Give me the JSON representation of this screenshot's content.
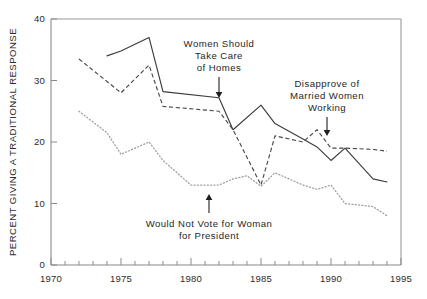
{
  "chart_data": {
    "type": "line",
    "title": "",
    "xlabel": "",
    "ylabel": "PERCENT GIVING A TRADITIONAL RESPONSE",
    "xlim": [
      1970,
      1995
    ],
    "ylim": [
      0,
      40
    ],
    "grid": false,
    "legend_position": "none (inline annotations with arrows)",
    "x_ticks_major": [
      1970,
      1975,
      1980,
      1985,
      1990,
      1995
    ],
    "x_tick_labels": [
      "1970",
      "1975",
      "1980",
      "1985",
      "1990",
      "1995"
    ],
    "x_ticks_minor_step": 1,
    "y_ticks": [
      0,
      10,
      20,
      30,
      40
    ],
    "y_tick_labels": [
      "0",
      "10",
      "20",
      "30",
      "40"
    ],
    "series": [
      {
        "name": "Women Should Take Care of Homes",
        "style": "solid",
        "color": "#3c3c3c",
        "x": [
          1974,
          1975,
          1977,
          1978,
          1982,
          1983,
          1985,
          1986,
          1988,
          1989,
          1990,
          1991,
          1993,
          1994
        ],
        "values": [
          34.0,
          34.8,
          37.0,
          28.2,
          27.2,
          22.0,
          26.0,
          23.0,
          20.5,
          19.2,
          17.0,
          19.0,
          14.0,
          13.5
        ]
      },
      {
        "name": "Disapprove of Married Women Working",
        "style": "dashed",
        "color": "#4a4a4a",
        "x": [
          1972,
          1975,
          1977,
          1978,
          1982,
          1983,
          1985,
          1986,
          1988,
          1989,
          1990,
          1991,
          1993,
          1994
        ],
        "values": [
          33.5,
          28.0,
          32.5,
          25.8,
          25.0,
          22.0,
          13.0,
          21.0,
          20.0,
          22.0,
          19.0,
          19.0,
          18.8,
          18.5
        ]
      },
      {
        "name": "Would Not Vote for Woman for President",
        "style": "dotted",
        "color": "#9d9d9d",
        "x": [
          1972,
          1974,
          1975,
          1977,
          1978,
          1980,
          1982,
          1983,
          1984,
          1985,
          1986,
          1988,
          1989,
          1990,
          1991,
          1993,
          1994
        ],
        "values": [
          25.0,
          21.5,
          18.0,
          20.0,
          17.0,
          13.0,
          13.0,
          14.0,
          14.5,
          12.8,
          15.0,
          13.0,
          12.3,
          13.0,
          10.0,
          9.5,
          8.0
        ]
      }
    ],
    "annotations": [
      {
        "id": "annotation-homes",
        "lines": [
          "Women Should",
          "Take Care",
          "of Homes"
        ],
        "points_to_series": "Women Should Take Care of Homes",
        "target_x": 1981.6,
        "target_y": 27.3,
        "arrow_direction": "down"
      },
      {
        "id": "annotation-married-working",
        "lines": [
          "Disapprove of",
          "Married Women",
          "Working"
        ],
        "points_to_series": "Disapprove of Married Women Working",
        "target_x": 1989.0,
        "target_y": 22.0,
        "arrow_direction": "down"
      },
      {
        "id": "annotation-president",
        "lines": [
          "Would Not Vote for Woman",
          "for President"
        ],
        "points_to_series": "Would Not Vote for Woman for President",
        "target_x": 1981.3,
        "target_y": 13.0,
        "arrow_direction": "up"
      }
    ]
  }
}
